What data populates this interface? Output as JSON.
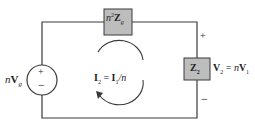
{
  "diagram": {
    "type": "equivalent circuit (ideal transformer reflected to secondary)",
    "source": {
      "label_prefix": "n",
      "label": "V",
      "sub": "g",
      "plus": "+",
      "minus": "−"
    },
    "series_impedance": {
      "prefix": "n",
      "sup": "2",
      "label": "Z",
      "sub": "g"
    },
    "load_impedance": {
      "label": "Z",
      "sub": "2"
    },
    "load_voltage": {
      "plus": "+",
      "minus": "−",
      "lhs": "V",
      "lhs_sub": "2",
      "eq": " = ",
      "rhs_prefix": "n",
      "rhs": "V",
      "rhs_sub": "1"
    },
    "loop_current": {
      "lhs": "I",
      "lhs_sub": "2",
      "eq": " = ",
      "rhs": "I",
      "rhs_sub": "1",
      "rhs_suffix": "/n"
    },
    "colors": {
      "wire": "#3a3a3a",
      "box_fill": "#bdbdbd",
      "box_stroke": "#3a3a3a"
    }
  }
}
